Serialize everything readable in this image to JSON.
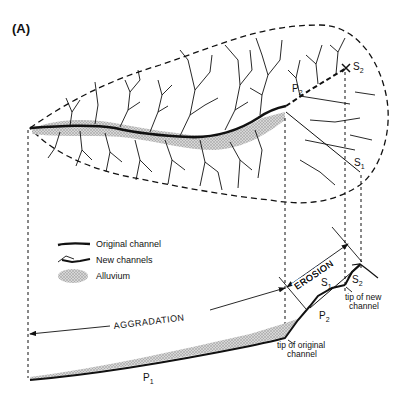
{
  "panel_label": "(A)",
  "legend": {
    "items": [
      {
        "label": "Original channel",
        "symbol": "thick-line"
      },
      {
        "label": "New channels",
        "symbol": "branching-line"
      },
      {
        "label": "Alluvium",
        "symbol": "stippled-ellipse"
      }
    ]
  },
  "annotations": {
    "aggradation": "AGGRADATION",
    "erosion": "EROSION",
    "tip_original": [
      "tip of original",
      "channel"
    ],
    "tip_new": [
      "tip of new",
      "channel"
    ]
  },
  "symbols": {
    "p1": {
      "base": "P",
      "sub": "1"
    },
    "p2_profile": {
      "base": "P",
      "sub": "2"
    },
    "p2_plan": {
      "base": "P",
      "sub": "2"
    },
    "s1_profile": {
      "base": "S",
      "sub": "1"
    },
    "s2_profile": {
      "base": "S",
      "sub": "2"
    },
    "s1_plan": {
      "base": "S",
      "sub": "1"
    },
    "s2_plan": {
      "base": "S",
      "sub": "2"
    }
  },
  "colors": {
    "ink": "#111111",
    "alluvium": "#b8b8b8",
    "background": "#ffffff"
  }
}
